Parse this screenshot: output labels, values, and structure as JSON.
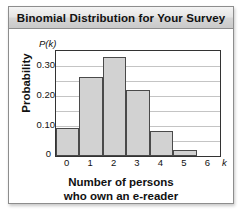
{
  "figure": {
    "title": "Binomial Distribution for Your Survey",
    "caption_line1": "Number of persons",
    "caption_line2": "who own an e-reader",
    "pk_label": "P(k)",
    "k_label": "k",
    "y_axis_title": "Probability",
    "zero_label": "0",
    "colors": {
      "bar_fill": "#d2d2d2",
      "bar_border": "#4a4a4a",
      "gridline": "#c4c4c4",
      "frame": "#333333",
      "title_text": "#111111",
      "panel_border": "#8d8d8d"
    }
  },
  "chart_data": {
    "type": "bar",
    "title": "Binomial Distribution for Your Survey",
    "xlabel": "Number of persons who own an e-reader",
    "ylabel": "Probability",
    "x_symbol": "k",
    "y_symbol": "P(k)",
    "categories": [
      "0",
      "1",
      "2",
      "3",
      "4",
      "5",
      "6"
    ],
    "values": [
      0.095,
      0.265,
      0.33,
      0.22,
      0.085,
      0.02,
      0.0
    ],
    "xlim": [
      -0.5,
      6.5
    ],
    "ylim": [
      0,
      0.35
    ],
    "xticks": [
      "0",
      "1",
      "2",
      "3",
      "4",
      "5",
      "6"
    ],
    "yticks": [
      "0",
      "0.10",
      "0.20",
      "0.30"
    ],
    "ytick_values": [
      0,
      0.1,
      0.2,
      0.3
    ],
    "gridline_values": [
      0.05,
      0.1,
      0.15,
      0.2,
      0.25,
      0.3,
      0.35
    ],
    "grid": true,
    "legend": null
  }
}
